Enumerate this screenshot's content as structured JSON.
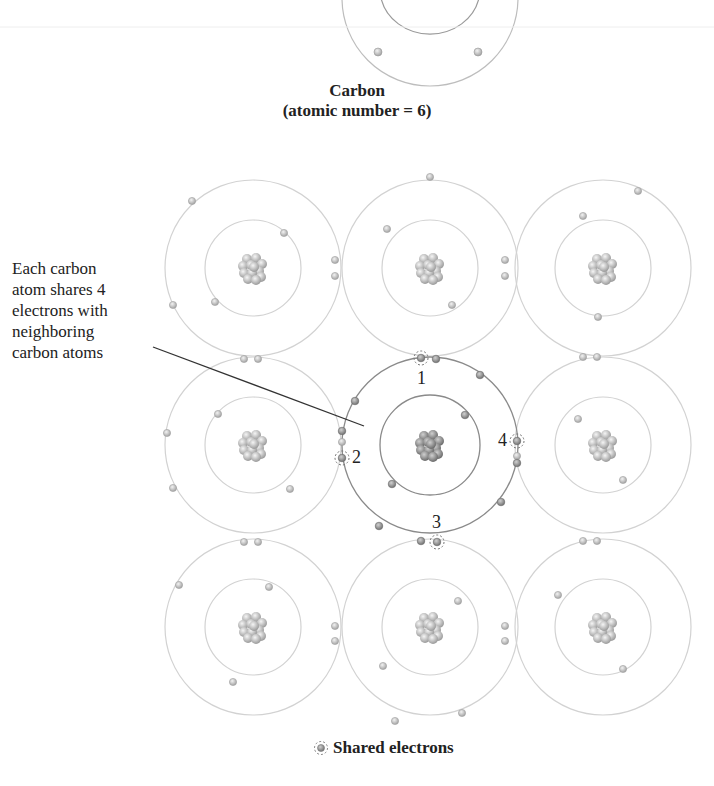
{
  "top_atom": {
    "name": "Carbon",
    "subtitle": "(atomic number = 6)"
  },
  "callout": {
    "lines": [
      "Each carbon",
      "atom shares 4",
      "electrons with",
      "neighboring",
      "carbon atoms"
    ]
  },
  "shared_labels": [
    "1",
    "2",
    "3",
    "4"
  ],
  "legend": {
    "label": "Shared electrons",
    "icon": "shared-electron-icon"
  },
  "lattice": {
    "rows": 3,
    "cols": 3,
    "center_atom": "Carbon",
    "colors": {
      "orbit_light": "#cfcfcf",
      "orbit_dark": "#8a8a8a",
      "electron": "#bdbdbd",
      "nucleus": "#a8a8a8",
      "text": "#222222"
    }
  }
}
